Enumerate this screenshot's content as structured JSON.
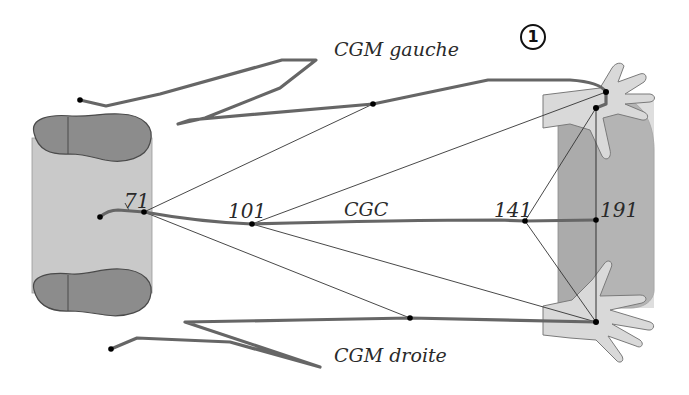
{
  "figure": {
    "panel_number": "1",
    "labels": {
      "cgm_left": "CGM gauche",
      "cgm_right": "CGM droite",
      "cgc": "CGC"
    },
    "frames": [
      {
        "id": "71",
        "label": "71"
      },
      {
        "id": "101",
        "label": "101"
      },
      {
        "id": "141",
        "label": "141"
      },
      {
        "id": "191",
        "label": "191"
      }
    ],
    "colors": {
      "trajectory": "#666666",
      "construction_line": "#333333",
      "feet_panel": "#c8c8c8",
      "foot_sole": "#8a8a8a",
      "hands_panel": "#a9a9a9",
      "hand": "#d6d6d6",
      "point": "#000000"
    }
  }
}
